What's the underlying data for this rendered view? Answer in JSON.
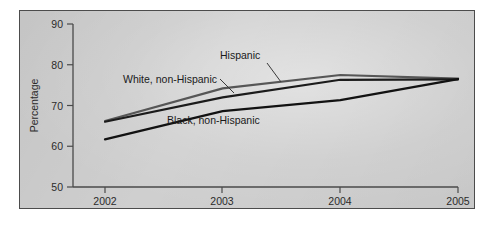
{
  "chart_data": {
    "type": "line",
    "title": "",
    "xlabel": "",
    "ylabel": "Percentage",
    "x": [
      "2002",
      "2003",
      "2004",
      "2005"
    ],
    "xlim": [
      "2002",
      "2005"
    ],
    "ylim": [
      50,
      90
    ],
    "yticks": [
      50,
      60,
      70,
      80,
      90
    ],
    "ytick_labels": [
      "50",
      "60",
      "70",
      "80",
      "90"
    ],
    "xticks": [
      "2002",
      "2003",
      "2004",
      "2005"
    ],
    "grid": false,
    "legend_position": "inline-annotations",
    "series": [
      {
        "name": "Hispanic",
        "color": "#565656",
        "values": [
          66.2,
          74.2,
          77.5,
          76.6
        ]
      },
      {
        "name": "White, non-Hispanic",
        "color": "#1b1b1b",
        "values": [
          66.0,
          72.0,
          76.3,
          76.4
        ]
      },
      {
        "name": "Black, non-Hispanic",
        "color": "#121212",
        "values": [
          61.7,
          68.6,
          71.3,
          76.5
        ]
      }
    ],
    "annotations": [
      {
        "text": "Hispanic",
        "series": "Hispanic"
      },
      {
        "text": "White, non-Hispanic",
        "series": "White, non-Hispanic"
      },
      {
        "text": "Black, non-Hispanic",
        "series": "Black, non-Hispanic"
      }
    ]
  },
  "figure": {
    "background_color": "#cfcfcf",
    "border_color": "#4c4c4c",
    "page_color": "#ffffff"
  }
}
